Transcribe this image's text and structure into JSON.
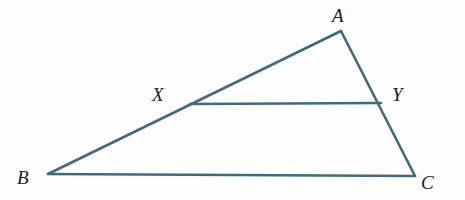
{
  "figure": {
    "kind": "geometry-diagram",
    "canvas": {
      "width": 465,
      "height": 200,
      "background": "#fefefe"
    },
    "style": {
      "stroke_color": "#3f6b7c",
      "stroke_width": 2.6,
      "label_color": "#1c1c1c",
      "label_font_size": 19
    },
    "points": [
      {
        "id": "A",
        "label": "A",
        "x": 341,
        "y": 31,
        "label_x": 332,
        "label_y": 6
      },
      {
        "id": "B",
        "label": "B",
        "x": 48,
        "y": 174,
        "label_x": 17,
        "label_y": 168
      },
      {
        "id": "C",
        "label": "C",
        "x": 415,
        "y": 176,
        "label_x": 421,
        "label_y": 173
      },
      {
        "id": "X",
        "label": "X",
        "x": 190,
        "y": 104,
        "label_x": 152,
        "label_y": 85
      },
      {
        "id": "Y",
        "label": "Y",
        "x": 381,
        "y": 103,
        "label_x": 392,
        "label_y": 85
      }
    ],
    "segments": [
      {
        "id": "AB",
        "from": "A",
        "to": "B",
        "x1": 341,
        "y1": 31,
        "x2": 48,
        "y2": 174
      },
      {
        "id": "AC",
        "from": "A",
        "to": "C",
        "x1": 341,
        "y1": 31,
        "x2": 415,
        "y2": 176
      },
      {
        "id": "BC",
        "from": "B",
        "to": "C",
        "x1": 48,
        "y1": 174,
        "x2": 415,
        "y2": 176
      },
      {
        "id": "XY",
        "from": "X",
        "to": "Y",
        "x1": 190,
        "y1": 104,
        "x2": 381,
        "y2": 103
      }
    ]
  }
}
